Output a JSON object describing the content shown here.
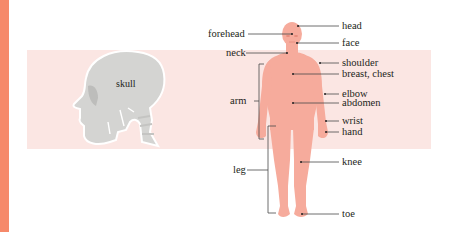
{
  "figure": {
    "colors": {
      "edge": "#f6896a",
      "band": "#fbe6e3",
      "body": "#f6ab9c",
      "body_shade": "#ee9a8a",
      "skull": "#d4d4d2",
      "skull_shade": "#bdbdbb",
      "leader": "#231f20"
    },
    "skull": {
      "label": "skull"
    },
    "labels_left": [
      {
        "id": "forehead",
        "text": "forehead"
      },
      {
        "id": "neck",
        "text": "neck"
      },
      {
        "id": "arm",
        "text": "arm"
      },
      {
        "id": "leg",
        "text": "leg"
      }
    ],
    "labels_right": [
      {
        "id": "head",
        "text": "head"
      },
      {
        "id": "face",
        "text": "face"
      },
      {
        "id": "shoulder",
        "text": "shoulder"
      },
      {
        "id": "breast-chest",
        "text": "breast, chest"
      },
      {
        "id": "elbow",
        "text": "elbow"
      },
      {
        "id": "abdomen",
        "text": "abdomen"
      },
      {
        "id": "wrist",
        "text": "wrist"
      },
      {
        "id": "hand",
        "text": "hand"
      },
      {
        "id": "knee",
        "text": "knee"
      },
      {
        "id": "toe",
        "text": "toe"
      }
    ]
  }
}
